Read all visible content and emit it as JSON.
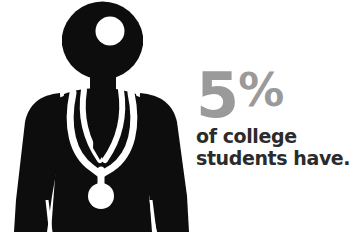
{
  "canvas": {
    "width": 358,
    "height": 249,
    "background_color": "#ffffff"
  },
  "illustration": {
    "name": "doctor-pictogram",
    "description": "Black silhouette of a doctor wearing a head mirror, necktie and stethoscope",
    "fill_color": "#0d0d0d",
    "detail_color": "#ffffff",
    "parts": [
      "head-with-head-mirror",
      "torso-coat",
      "left-sleeve",
      "right-sleeve",
      "collar-v",
      "necktie",
      "stethoscope"
    ]
  },
  "stat": {
    "value": "5",
    "percent_symbol": "%",
    "value_color": "#9a9a9a",
    "caption_color": "#2b2b2b",
    "caption_line_1": "of college",
    "caption_line_2": "students have."
  }
}
